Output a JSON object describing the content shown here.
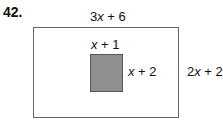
{
  "problem_number": "42.",
  "outer_rectangle": {
    "width_label": "3x + 6",
    "height_label": "2x + 2"
  },
  "inner_square": {
    "width_label": "x + 1",
    "height_label": "x + 2",
    "fill_color": "#8f8f8f"
  }
}
